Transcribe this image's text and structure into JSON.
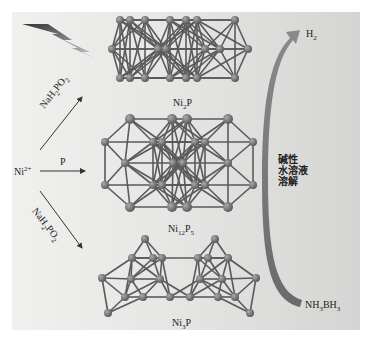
{
  "diagram": {
    "reactant": {
      "base": "Ni",
      "sup": "2+"
    },
    "reagents": {
      "top": {
        "parts": [
          "NaH",
          "2",
          "PO",
          "2"
        ]
      },
      "middle": "P",
      "bottom": {
        "parts": [
          "NaH",
          "2",
          "PO",
          "2"
        ]
      }
    },
    "products": [
      {
        "name": "ni2p",
        "parts": [
          "Ni",
          "2",
          "P",
          ""
        ]
      },
      {
        "name": "ni12p5",
        "parts": [
          "Ni",
          "12",
          "P",
          "5"
        ]
      },
      {
        "name": "ni3p",
        "parts": [
          "Ni",
          "3",
          "P",
          ""
        ]
      }
    ],
    "hydrolysis": {
      "condition_lines": [
        "碱性",
        "水溶液",
        "溶解"
      ],
      "start": {
        "parts": [
          "NH",
          "3",
          "BH",
          "3"
        ]
      },
      "end": {
        "parts": [
          "H",
          "2"
        ]
      }
    },
    "icons": [
      "lightning-icon"
    ],
    "colors": {
      "atom": "#6e6e6e",
      "bond": "#555555",
      "arrow": "#7a7a7a",
      "background": "#e6e6e4"
    }
  }
}
